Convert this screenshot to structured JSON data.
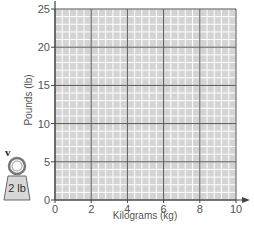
{
  "chart_data": {
    "type": "line",
    "title": "",
    "xlabel": "Kilograms (kg)",
    "ylabel": "Pounds (lb)",
    "xlim": [
      0,
      10
    ],
    "ylim": [
      0,
      25
    ],
    "x_ticks": [
      0,
      2,
      4,
      6,
      8,
      10
    ],
    "y_ticks": [
      0,
      5,
      10,
      15,
      20,
      25
    ],
    "x_tick_labels": [
      "0",
      "2",
      "4",
      "6",
      "8",
      "10"
    ],
    "y_tick_labels": [
      "0",
      "5",
      "10",
      "15",
      "20",
      "25"
    ],
    "grid": true,
    "minor_grid": {
      "x_step": 0.4,
      "y_step": 1
    },
    "series": [],
    "legend": null
  },
  "annotation": {
    "marker": "v",
    "weight_label": "2 lb"
  },
  "colors": {
    "plot_fill": "#d4d4d4",
    "minor_grid": "#ffffff",
    "major_grid": "#555555",
    "axis": "#444444"
  }
}
